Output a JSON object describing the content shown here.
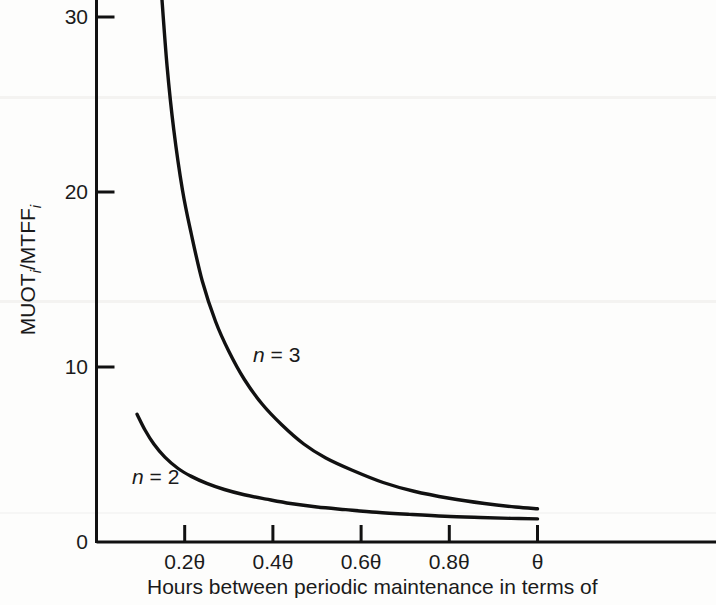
{
  "figure": {
    "background_color": "#fdfdfc",
    "ink_color": "#111111"
  },
  "axes": {
    "y_title_main": "MUOT",
    "y_title_sub1": "i",
    "y_title_mid": "/MTFF",
    "y_title_sub2": "i",
    "y_title_full": "MUOT_i/MTFF_i",
    "x_title": "Hours between periodic maintenance in terms of"
  },
  "chart_data": {
    "type": "line",
    "title": "",
    "xlabel": "Hours between periodic maintenance in terms of",
    "ylabel": "MUOT_i/MTFF_i",
    "grid": false,
    "legend_position": "inline-curve-labels",
    "xlim": [
      0,
      1.0
    ],
    "ylim": [
      0,
      31.5
    ],
    "x_tick_values": [
      0.2,
      0.4,
      0.6,
      0.8,
      1.0
    ],
    "x_tick_labels": [
      "0.2θ",
      "0.4θ",
      "0.6θ",
      "0.8θ",
      "θ"
    ],
    "x_origin_label": "0",
    "y_tick_values": [
      0,
      10,
      20,
      30
    ],
    "y_tick_labels": [
      "0",
      "10",
      "20",
      "30"
    ],
    "series": [
      {
        "name": "n = 3",
        "label_text": "n = 3",
        "x": [
          0.147,
          0.16,
          0.175,
          0.195,
          0.215,
          0.24,
          0.27,
          0.3,
          0.335,
          0.375,
          0.42,
          0.47,
          0.52,
          0.58,
          0.65,
          0.72,
          0.8,
          0.88,
          0.95,
          1.0
        ],
        "y": [
          31.5,
          27.2,
          23.6,
          20.1,
          17.6,
          14.9,
          12.6,
          10.9,
          9.3,
          7.9,
          6.7,
          5.6,
          4.8,
          4.1,
          3.4,
          2.9,
          2.5,
          2.2,
          2.0,
          1.9
        ]
      },
      {
        "name": "n = 2",
        "label_text": "n = 2",
        "x": [
          0.092,
          0.11,
          0.13,
          0.155,
          0.185,
          0.215,
          0.25,
          0.29,
          0.335,
          0.385,
          0.44,
          0.5,
          0.565,
          0.635,
          0.71,
          0.79,
          0.87,
          0.94,
          1.0
        ],
        "y": [
          7.3,
          6.4,
          5.6,
          4.85,
          4.2,
          3.75,
          3.35,
          3.0,
          2.7,
          2.45,
          2.2,
          2.0,
          1.85,
          1.7,
          1.58,
          1.47,
          1.4,
          1.35,
          1.32
        ]
      }
    ]
  }
}
